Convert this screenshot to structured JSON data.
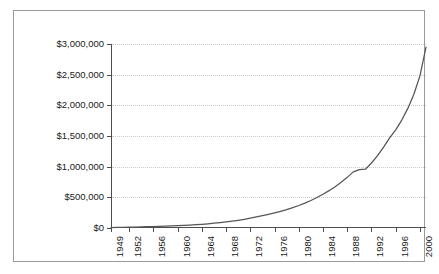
{
  "chart_data": {
    "type": "line",
    "title": "",
    "subtitle": "",
    "xlabel": "",
    "ylabel": "",
    "legend": [],
    "legend_position": "none",
    "grid": true,
    "grid_style": "dotted-horizontal",
    "line_color": "#555555",
    "text_color": "#1a1a1a",
    "grid_color": "#cccccc",
    "axis_color": "#4d4d4d",
    "background": "#ffffff",
    "xlim": [
      1949,
      2001
    ],
    "ylim": [
      0,
      3000000
    ],
    "x_tick_labels": [
      "1949",
      "1952",
      "1956",
      "1960",
      "1964",
      "1968",
      "1972",
      "1976",
      "1980",
      "1984",
      "1988",
      "1992",
      "1996",
      "2000"
    ],
    "x_tick_values": [
      1949,
      1952,
      1956,
      1960,
      1964,
      1968,
      1972,
      1976,
      1980,
      1984,
      1988,
      1992,
      1996,
      2000
    ],
    "x_tick_rotation": 90,
    "y_tick_labels": [
      "$0",
      "$500,000",
      "$1,000,000",
      "$1,500,000",
      "$2,000,000",
      "$2,500,000",
      "$3,000,000"
    ],
    "y_tick_values": [
      0,
      500000,
      1000000,
      1500000,
      2000000,
      2500000,
      3000000
    ],
    "y_tick_format": "$#,##0",
    "series": [
      {
        "name": "value",
        "x": [
          1949,
          1950,
          1951,
          1952,
          1953,
          1954,
          1955,
          1956,
          1957,
          1958,
          1959,
          1960,
          1961,
          1962,
          1963,
          1964,
          1965,
          1966,
          1967,
          1968,
          1969,
          1970,
          1971,
          1972,
          1973,
          1974,
          1975,
          1976,
          1977,
          1978,
          1979,
          1980,
          1981,
          1982,
          1983,
          1984,
          1985,
          1986,
          1987,
          1988,
          1989,
          1990,
          1991,
          1992,
          1993,
          1994,
          1995,
          1996,
          1997,
          1998,
          1999,
          2000,
          2001
        ],
        "values": [
          8000,
          10000,
          12000,
          14000,
          16000,
          18000,
          21000,
          24000,
          27000,
          30000,
          34000,
          38000,
          43000,
          48000,
          54000,
          61000,
          69000,
          78000,
          88000,
          99000,
          112000,
          126000,
          142000,
          160000,
          180000,
          200000,
          222000,
          246000,
          272000,
          300000,
          332000,
          367000,
          406000,
          449000,
          497000,
          550000,
          609000,
          674000,
          746000,
          826000,
          915000,
          952000,
          958000,
          1060000,
          1180000,
          1320000,
          1470000,
          1600000,
          1760000,
          1950000,
          2180000,
          2480000,
          2950000
        ]
      }
    ]
  }
}
